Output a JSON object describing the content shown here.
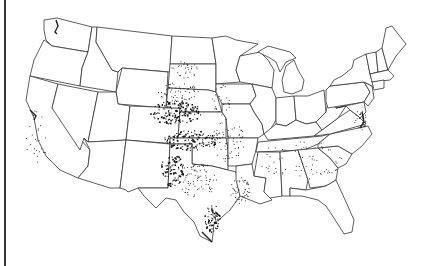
{
  "map": {
    "subject": "United States (contiguous) state boundaries with point occurrences",
    "colors": {
      "background": "#ffffff",
      "boundary": "#333333",
      "points": "#111111"
    },
    "point_clusters": [
      {
        "region": "Kansas",
        "density": "high",
        "cx": 175,
        "cy": 112,
        "rx": 26,
        "ry": 12,
        "n": 170
      },
      {
        "region": "Nebraska-SE",
        "density": "medium",
        "cx": 178,
        "cy": 92,
        "rx": 20,
        "ry": 10,
        "n": 60
      },
      {
        "region": "South-Dakota",
        "density": "low",
        "cx": 185,
        "cy": 70,
        "rx": 14,
        "ry": 10,
        "n": 30
      },
      {
        "region": "Oklahoma",
        "density": "high",
        "cx": 190,
        "cy": 140,
        "rx": 28,
        "ry": 10,
        "n": 120
      },
      {
        "region": "Texas-Panhandle-West",
        "density": "high",
        "cx": 172,
        "cy": 170,
        "rx": 12,
        "ry": 16,
        "n": 90
      },
      {
        "region": "Texas-Central",
        "density": "medium",
        "cx": 198,
        "cy": 180,
        "rx": 20,
        "ry": 18,
        "n": 80
      },
      {
        "region": "Texas-Coast",
        "density": "high",
        "cx": 212,
        "cy": 218,
        "rx": 8,
        "ry": 14,
        "n": 70
      },
      {
        "region": "Arkansas-Missouri",
        "density": "medium",
        "cx": 228,
        "cy": 140,
        "rx": 16,
        "ry": 22,
        "n": 70
      },
      {
        "region": "Louisiana",
        "density": "medium",
        "cx": 240,
        "cy": 190,
        "rx": 10,
        "ry": 14,
        "n": 50
      },
      {
        "region": "Southeast",
        "density": "low",
        "cx": 300,
        "cy": 160,
        "rx": 45,
        "ry": 20,
        "n": 70
      },
      {
        "region": "Iowa-Illinois",
        "density": "low",
        "cx": 222,
        "cy": 100,
        "rx": 10,
        "ry": 15,
        "n": 25
      },
      {
        "region": "California",
        "density": "low",
        "cx": 36,
        "cy": 140,
        "rx": 10,
        "ry": 30,
        "n": 25
      },
      {
        "region": "Chesapeake",
        "density": "medium",
        "cx": 360,
        "cy": 120,
        "rx": 6,
        "ry": 10,
        "n": 25
      }
    ]
  }
}
